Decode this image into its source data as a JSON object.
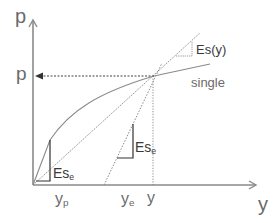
{
  "diagram": {
    "axes": {
      "y_axis_label": "p",
      "x_axis_label": "y"
    },
    "labels": {
      "p_level": "p",
      "curve_name": "single",
      "secant_slope": "Es(y)",
      "elastic_slope_main": "Es",
      "elastic_slope_main_sub": "e",
      "elastic_slope_origin": "Es",
      "elastic_slope_origin_sub": "e",
      "yp_main": "y",
      "yp_sub": "p",
      "ye_main": "y",
      "ye_sub": "e",
      "y_point": "y"
    },
    "colors": {
      "axis": "#8a8a8a",
      "curve": "#8a8a8a",
      "dotted": "#555555",
      "triangle": "#333333",
      "text": "#6a6a6a"
    }
  }
}
